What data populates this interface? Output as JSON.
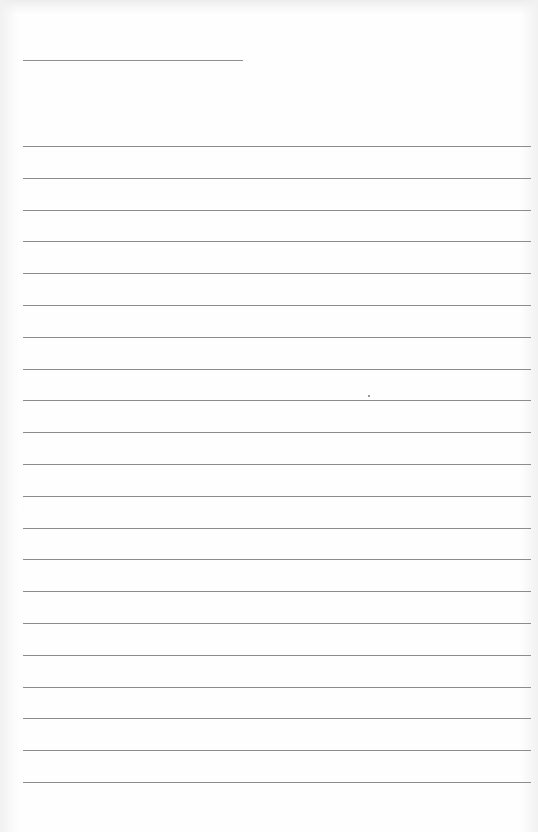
{
  "document": {
    "type": "blank lined paper",
    "header_line": {
      "top": 60,
      "left": 23,
      "width": 220
    },
    "ruled_lines": {
      "count": 21,
      "first_top": 146,
      "spacing": 31.8,
      "left": 23,
      "right_margin": 7
    },
    "colors": {
      "paper": "#fefefe",
      "line": "#8c8c8c"
    },
    "speck": {
      "left": 368,
      "top": 395
    }
  }
}
